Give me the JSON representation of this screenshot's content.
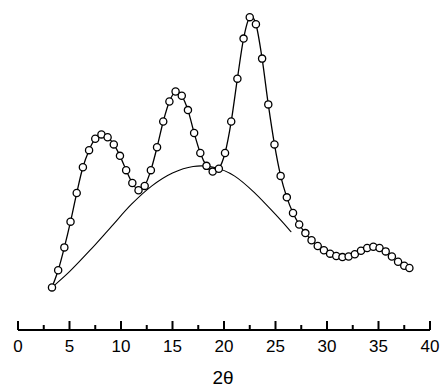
{
  "chart_data": {
    "type": "line",
    "title": "",
    "subtitle": "",
    "xlabel": "2θ",
    "ylabel": "",
    "xlim": [
      0,
      40
    ],
    "ylim": [
      0,
      100
    ],
    "grid": false,
    "legend": null,
    "xticks": [
      0,
      5,
      10,
      15,
      20,
      25,
      30,
      35,
      40
    ],
    "xticklabels": [
      "0",
      "5",
      "10",
      "15",
      "20",
      "25",
      "30",
      "35",
      "40"
    ],
    "minor_tick_step": 2.5,
    "yaxis_visible": false,
    "annotations": [],
    "series": [
      {
        "name": "diffraction-pattern",
        "marker": "open-circle",
        "line": "solid",
        "color": "#000000",
        "x": [
          3.3,
          3.9,
          4.5,
          5.1,
          5.7,
          6.3,
          6.9,
          7.5,
          8.1,
          8.7,
          9.3,
          9.9,
          10.5,
          11.1,
          11.7,
          12.3,
          12.9,
          13.5,
          14.1,
          14.7,
          15.3,
          15.9,
          16.5,
          17.1,
          17.7,
          18.3,
          18.9,
          19.5,
          20.1,
          20.7,
          21.3,
          21.9,
          22.5,
          23.1,
          23.7,
          24.3,
          24.9,
          25.5,
          26.1,
          26.7,
          27.3,
          27.9,
          28.5,
          29.1,
          29.7,
          30.3,
          30.9,
          31.5,
          32.1,
          32.7,
          33.3,
          33.9,
          34.5,
          35.1,
          35.7,
          36.3,
          36.9,
          37.5,
          38.0
        ],
        "y": [
          3.0,
          9.0,
          17.0,
          26.0,
          36.0,
          45.0,
          51.0,
          55.0,
          56.5,
          55.5,
          53.0,
          49.0,
          44.0,
          39.5,
          37.0,
          38.5,
          44.0,
          52.0,
          61.0,
          68.0,
          71.5,
          70.0,
          65.0,
          57.0,
          50.0,
          45.5,
          43.5,
          44.5,
          50.0,
          61.0,
          76.0,
          90.0,
          97.5,
          95.0,
          83.0,
          67.0,
          53.0,
          42.0,
          34.5,
          29.0,
          25.0,
          22.0,
          19.5,
          17.5,
          16.0,
          14.8,
          14.0,
          13.6,
          13.8,
          14.6,
          15.8,
          16.8,
          17.2,
          16.8,
          15.6,
          13.8,
          12.0,
          10.6,
          9.8
        ]
      },
      {
        "name": "amorphous-background",
        "marker": "none",
        "line": "solid",
        "color": "#000000",
        "x": [
          3.3,
          5.0,
          7.0,
          9.0,
          11.0,
          13.0,
          15.0,
          17.0,
          19.0,
          21.0,
          23.0,
          25.0,
          26.5
        ],
        "y": [
          3.0,
          8.5,
          16.0,
          24.0,
          32.0,
          38.5,
          43.0,
          45.3,
          45.0,
          42.0,
          36.0,
          28.5,
          22.5
        ]
      }
    ]
  },
  "axis": {
    "x_axis_label": "2θ",
    "tick_count": 9
  }
}
